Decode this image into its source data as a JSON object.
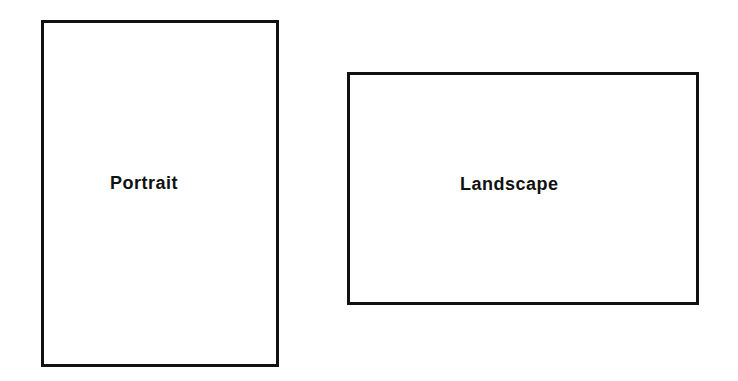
{
  "diagram": {
    "shapes": [
      {
        "id": "portrait",
        "shape": "rectangle",
        "orientation": "vertical",
        "label": "Portrait"
      },
      {
        "id": "landscape",
        "shape": "rectangle",
        "orientation": "horizontal",
        "label": "Landscape"
      }
    ],
    "colors": {
      "stroke": "#111111",
      "fill": "#ffffff",
      "text": "#111111"
    }
  }
}
